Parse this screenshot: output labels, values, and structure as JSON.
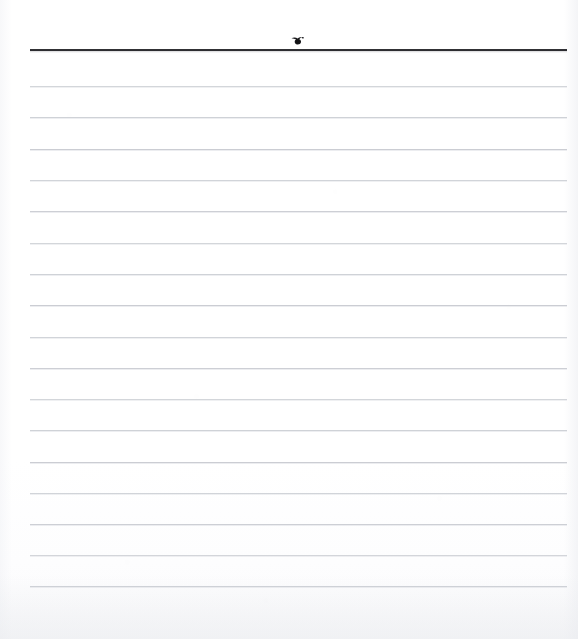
{
  "document": {
    "kind": "scanned-blank-ruled-page",
    "title": "Blank ruled notebook page (scan)",
    "page_width": 578,
    "page_height": 639,
    "background_color": "#ffffff",
    "has_text_content": false,
    "written_text": ""
  },
  "header_rule": {
    "name": "header-rule",
    "color": "#1d1d20",
    "thickness_px": 2,
    "x_start": 30,
    "x_end": 567,
    "y": 49
  },
  "ink_mark": {
    "name": "ink-mark",
    "description": "small dark ink smudge / doodle above the header rule",
    "color": "#1a1a1d",
    "center_x": 298,
    "center_y": 40,
    "width_px": 14,
    "height_px": 10
  },
  "ruled_lines": {
    "name": "ruled-lines",
    "count": 17,
    "color": "#c9ccd2",
    "thickness_px": 1,
    "x_start": 30,
    "x_end": 567,
    "spacing_px": 31.3,
    "y_positions": [
      86,
      117,
      149,
      180,
      211,
      243,
      274,
      305,
      337,
      368,
      399,
      430,
      462,
      493,
      524,
      555,
      586
    ]
  },
  "margins": {
    "left_blank_px": 30,
    "right_blank_px": 11,
    "top_blank_px": 30,
    "bottom_blank_px": 53
  }
}
